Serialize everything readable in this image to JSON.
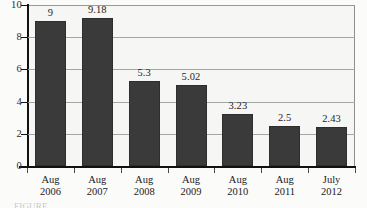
{
  "chart_data": {
    "type": "bar",
    "title": "",
    "subtitle": "",
    "xlabel": "",
    "ylabel": "",
    "categories": [
      "Aug 2006",
      "Aug 2007",
      "Aug 2008",
      "Aug 2009",
      "Aug 2010",
      "Aug 2011",
      "July 2012"
    ],
    "category_lines": [
      {
        "line1": "Aug",
        "line2": "2006"
      },
      {
        "line1": "Aug",
        "line2": "2007"
      },
      {
        "line1": "Aug",
        "line2": "2008"
      },
      {
        "line1": "Aug",
        "line2": "2009"
      },
      {
        "line1": "Aug",
        "line2": "2010"
      },
      {
        "line1": "Aug",
        "line2": "2011"
      },
      {
        "line1": "July",
        "line2": "2012"
      }
    ],
    "values": [
      9,
      9.18,
      5.3,
      5.02,
      3.23,
      2.5,
      2.43
    ],
    "value_labels": [
      "9",
      "9.18",
      "5.3",
      "5.02",
      "3.23",
      "2.5",
      "2.43"
    ],
    "ylim": [
      0,
      10
    ],
    "ytick_values": [
      10,
      8,
      6,
      4,
      2,
      0
    ],
    "ytick_labels": [
      "10",
      "8",
      "6",
      "4",
      "2",
      "0"
    ],
    "grid": true,
    "legend": "none",
    "bar_color": "#3a3a3a",
    "plot_background": "#f6f6f4",
    "axis_color": "#111111",
    "gridline_color": "#a6a6a6"
  },
  "caption": {
    "text": "FIGURE"
  }
}
